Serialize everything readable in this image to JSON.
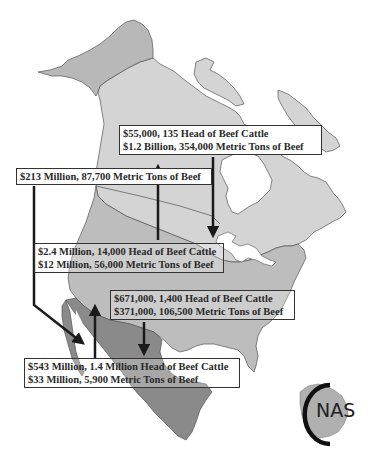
{
  "map": {
    "title": "North American beef trade flows",
    "colors": {
      "background": "#ffffff",
      "alaska": "#b8b8b8",
      "canada": "#d4d4d4",
      "usa": "#bdbdbd",
      "mexico": "#8a8a8a",
      "water": "#ffffff",
      "border_line": "#555555",
      "arrow": "#1a1a1a",
      "box_border": "#333333"
    },
    "regions": [
      "Alaska",
      "Canada",
      "United States",
      "Mexico"
    ]
  },
  "labels": {
    "canada_to_us": {
      "line1": "$55,000, 135 Head of Beef Cattle",
      "line2": "$1.2 Billion, 354,000 Metric Tons of Beef"
    },
    "us_to_mexico_beef": {
      "line1": "$213 Million, 87,700 Metric Tons of Beef"
    },
    "us_to_canada": {
      "line1": "$2.4 Million, 14,000 Head of Beef Cattle",
      "line2": "$12 Million, 56,000 Metric Tons of Beef"
    },
    "us_to_mexico": {
      "line1": "$671,000, 1,400 Head of Beef Cattle",
      "line2": "$371,000, 106,500 Metric Tons of Beef"
    },
    "mexico_to_us": {
      "line1": "$543 Million, 1.4 Million Head of Beef Cattle",
      "line2": "$33 Million, 5,900 Metric Tons of Beef"
    }
  },
  "logo": {
    "text": "NAS",
    "prefix_glyph": "C"
  }
}
